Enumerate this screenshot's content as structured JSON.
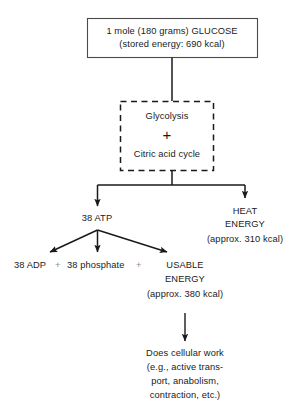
{
  "diagram": {
    "colors": {
      "ink": "#1a1a1a",
      "line": "#1a1a1a",
      "light_plus": "#8d8d8d",
      "background": "#ffffff"
    },
    "glucose_box": {
      "line1": "1 mole (180 grams) GLUCOSE",
      "line2": "(stored energy: 690 kcal)"
    },
    "pathway_box": {
      "line1": "Glycolysis",
      "operator": "+",
      "line2": "Citric acid cycle"
    },
    "atp_node": {
      "label": "38  ATP"
    },
    "heat_node": {
      "line1": "HEAT",
      "line2": "ENERGY",
      "line3": "(approx. 310 kcal)"
    },
    "products_row": {
      "adp": "38  ADP",
      "plus1": "+",
      "phosphate": "38  phosphate",
      "plus2": "+"
    },
    "usable_energy": {
      "line1": "USABLE",
      "line2": "ENERGY",
      "line3": "(approx. 380 kcal)"
    },
    "cellular_work": {
      "line1": "Does cellular work",
      "line2": "(e.g., active trans-",
      "line3": "port, anabolism,",
      "line4": "contraction, etc.)"
    }
  }
}
